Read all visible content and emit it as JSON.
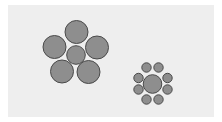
{
  "figure": {
    "colors": {
      "background": "#ffffff",
      "panel": "#eeeeee",
      "circle_fill": "#8e8e8e",
      "circle_stroke": "#4a4a4a"
    },
    "left_group": {
      "center": {
        "cx": 76,
        "cy": 55,
        "r": 9.3
      },
      "surround": [
        {
          "cx": 76.5,
          "cy": 32,
          "r": 11.5
        },
        {
          "cx": 54.5,
          "cy": 47,
          "r": 11.5
        },
        {
          "cx": 97,
          "cy": 47.5,
          "r": 11.5
        },
        {
          "cx": 62,
          "cy": 71.5,
          "r": 11.5
        },
        {
          "cx": 88.5,
          "cy": 72,
          "r": 11.5
        }
      ]
    },
    "right_group": {
      "center": {
        "cx": 152.5,
        "cy": 84,
        "r": 9.3
      },
      "surround": [
        {
          "cx": 146.5,
          "cy": 67.5,
          "r": 4.7
        },
        {
          "cx": 158.5,
          "cy": 67.5,
          "r": 4.7
        },
        {
          "cx": 138.5,
          "cy": 78,
          "r": 4.7
        },
        {
          "cx": 167.5,
          "cy": 78,
          "r": 4.7
        },
        {
          "cx": 138.5,
          "cy": 89.5,
          "r": 4.7
        },
        {
          "cx": 167.5,
          "cy": 89.5,
          "r": 4.7
        },
        {
          "cx": 146.5,
          "cy": 99.5,
          "r": 4.7
        },
        {
          "cx": 158.5,
          "cy": 99.5,
          "r": 4.7
        }
      ]
    }
  }
}
